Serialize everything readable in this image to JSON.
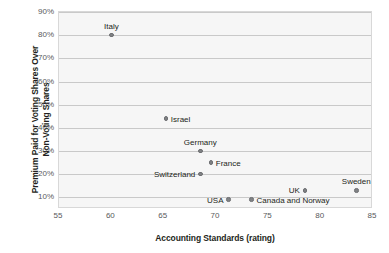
{
  "chart_data": {
    "type": "scatter",
    "title": "",
    "xlabel": "Accounting Standards (rating)",
    "ylabel_line1": "Premium Paid for Voting Shares Over",
    "ylabel_line2": "Non-Voting Shares",
    "xlim": [
      55,
      85
    ],
    "ylim": [
      5,
      90
    ],
    "grid": true,
    "legend": "none",
    "x_ticks": [
      {
        "value": 55,
        "label": "55"
      },
      {
        "value": 60,
        "label": "60"
      },
      {
        "value": 65,
        "label": "65"
      },
      {
        "value": 70,
        "label": "70"
      },
      {
        "value": 75,
        "label": "75"
      },
      {
        "value": 80,
        "label": "80"
      },
      {
        "value": 85,
        "label": "85"
      }
    ],
    "y_ticks": [
      {
        "value": 90,
        "label": "90%"
      },
      {
        "value": 80,
        "label": "80%"
      },
      {
        "value": 70,
        "label": "70%"
      },
      {
        "value": 60,
        "label": "60%"
      },
      {
        "value": 50,
        "label": "50%"
      },
      {
        "value": 40,
        "label": "40%"
      },
      {
        "value": 30,
        "label": "30%"
      },
      {
        "value": 20,
        "label": "20%"
      },
      {
        "value": 10,
        "label": "10%"
      }
    ],
    "points": [
      {
        "label": "Italy",
        "x": 60.0,
        "y": 80,
        "label_pos": "above"
      },
      {
        "label": "Israel",
        "x": 65.2,
        "y": 44,
        "label_pos": "right"
      },
      {
        "label": "Germany",
        "x": 68.5,
        "y": 30,
        "label_pos": "above"
      },
      {
        "label": "France",
        "x": 69.5,
        "y": 25,
        "label_pos": "right"
      },
      {
        "label": "Switzerland",
        "x": 68.5,
        "y": 20,
        "label_pos": "left"
      },
      {
        "label": "USA",
        "x": 71.2,
        "y": 9,
        "label_pos": "left"
      },
      {
        "label": "Canada and Norway",
        "x": 73.4,
        "y": 9,
        "label_pos": "right"
      },
      {
        "label": "UK",
        "x": 78.5,
        "y": 13,
        "label_pos": "left"
      },
      {
        "label": "Sweden",
        "x": 83.4,
        "y": 13,
        "label_pos": "above"
      }
    ],
    "series_color": "#808285"
  }
}
